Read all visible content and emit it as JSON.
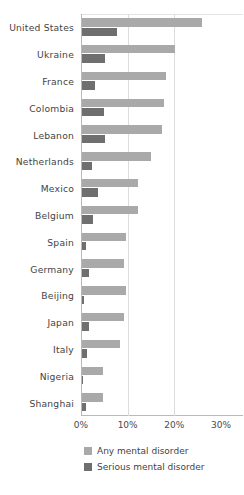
{
  "chart_data": {
    "type": "bar",
    "orientation": "horizontal",
    "title": "",
    "xlabel": "",
    "ylabel": "",
    "xlim": [
      0,
      30
    ],
    "xunit": "%",
    "xticks": [
      "0%",
      "10%",
      "20%",
      "30%"
    ],
    "xtick_values": [
      0,
      10,
      20,
      30
    ],
    "grid": "vertical",
    "legend_position": "bottom-left",
    "categories": [
      "United States",
      "Ukraine",
      "France",
      "Colombia",
      "Lebanon",
      "Netherlands",
      "Mexico",
      "Belgium",
      "Spain",
      "Germany",
      "Beijing",
      "Japan",
      "Italy",
      "Nigeria",
      "Shanghai"
    ],
    "series": [
      {
        "name": "Any mental disorder",
        "color": "#a9a9a9",
        "values": [
          25.8,
          20.0,
          18.1,
          17.5,
          17.1,
          14.8,
          12.1,
          12.0,
          9.4,
          9.1,
          9.5,
          9.0,
          8.2,
          4.5,
          4.5
        ]
      },
      {
        "name": "Serious mental disorder",
        "color": "#6f6f6f",
        "values": [
          7.5,
          4.9,
          2.7,
          4.8,
          4.9,
          2.1,
          3.4,
          2.4,
          0.9,
          1.5,
          0.4,
          1.5,
          1.0,
          0.3,
          0.8
        ]
      }
    ]
  },
  "colors": {
    "any": "#a9a9a9",
    "serious": "#6f6f6f",
    "gridline": "#dcdcdc",
    "axis": "#b9b9b9",
    "text": "#444444",
    "background": "#ffffff"
  },
  "top_clip": {
    "ghost_text": ""
  }
}
